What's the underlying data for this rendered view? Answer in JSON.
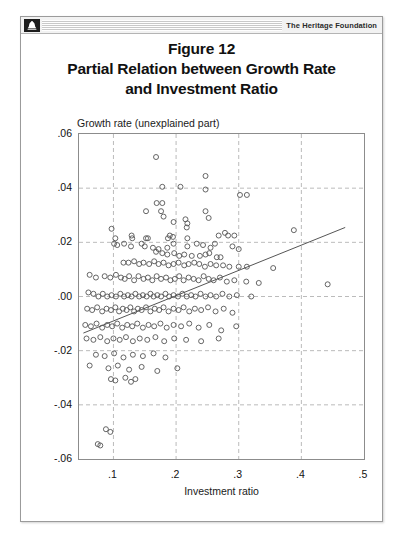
{
  "header": {
    "logo_icon": "liberty-bell-icon",
    "brand": "The Heritage Foundation"
  },
  "figure": {
    "title_lines": [
      "Figure 12",
      "Partial Relation between Growth Rate",
      "and Investment Ratio"
    ]
  },
  "chart_data": {
    "type": "scatter",
    "title": "Partial Relation between Growth Rate and Investment Ratio",
    "subtitle": "Figure 12",
    "xlabel": "Investment ratio",
    "ylabel": "Growth rate (unexplained part)",
    "xlim": [
      0.045,
      0.5
    ],
    "ylim": [
      -0.06,
      0.06
    ],
    "xticks": [
      0.1,
      0.2,
      0.3,
      0.4,
      0.5
    ],
    "xtick_labels": [
      ".1",
      ".2",
      ".3",
      ".4",
      ".5"
    ],
    "yticks": [
      -0.06,
      -0.04,
      -0.02,
      0.0,
      0.02,
      0.04,
      0.06
    ],
    "ytick_labels": [
      "-.06",
      "-.04",
      "-.02",
      ".00",
      ".02",
      ".04",
      ".06"
    ],
    "grid": true,
    "grid_style": "dashed",
    "legend": null,
    "marker": "open-circle",
    "marker_color": "#555555",
    "fit_line": {
      "name": "partial regression line",
      "color": "#555555",
      "x": [
        0.052,
        0.47
      ],
      "y": [
        -0.0135,
        0.0255
      ]
    },
    "points": [
      [
        0.168,
        0.0515
      ],
      [
        0.247,
        0.0445
      ],
      [
        0.247,
        0.0395
      ],
      [
        0.178,
        0.0405
      ],
      [
        0.207,
        0.0405
      ],
      [
        0.302,
        0.0375
      ],
      [
        0.313,
        0.0375
      ],
      [
        0.169,
        0.0345
      ],
      [
        0.178,
        0.0345
      ],
      [
        0.152,
        0.0315
      ],
      [
        0.176,
        0.0315
      ],
      [
        0.247,
        0.0315
      ],
      [
        0.18,
        0.0295
      ],
      [
        0.252,
        0.029
      ],
      [
        0.196,
        0.0275
      ],
      [
        0.215,
        0.0285
      ],
      [
        0.218,
        0.027
      ],
      [
        0.217,
        0.0255
      ],
      [
        0.097,
        0.025
      ],
      [
        0.388,
        0.0245
      ],
      [
        0.129,
        0.0225
      ],
      [
        0.103,
        0.0215
      ],
      [
        0.13,
        0.0215
      ],
      [
        0.152,
        0.0215
      ],
      [
        0.155,
        0.0215
      ],
      [
        0.187,
        0.0215
      ],
      [
        0.19,
        0.0225
      ],
      [
        0.195,
        0.022
      ],
      [
        0.218,
        0.0215
      ],
      [
        0.268,
        0.0225
      ],
      [
        0.278,
        0.0235
      ],
      [
        0.283,
        0.0225
      ],
      [
        0.293,
        0.0225
      ],
      [
        0.101,
        0.0195
      ],
      [
        0.106,
        0.019
      ],
      [
        0.117,
        0.0195
      ],
      [
        0.128,
        0.0185
      ],
      [
        0.145,
        0.0195
      ],
      [
        0.15,
        0.0185
      ],
      [
        0.163,
        0.018
      ],
      [
        0.172,
        0.0175
      ],
      [
        0.186,
        0.018
      ],
      [
        0.196,
        0.0195
      ],
      [
        0.218,
        0.0185
      ],
      [
        0.233,
        0.0195
      ],
      [
        0.243,
        0.019
      ],
      [
        0.255,
        0.018
      ],
      [
        0.262,
        0.0195
      ],
      [
        0.29,
        0.0185
      ],
      [
        0.3,
        0.0175
      ],
      [
        0.168,
        0.0165
      ],
      [
        0.178,
        0.016
      ],
      [
        0.186,
        0.0155
      ],
      [
        0.197,
        0.016
      ],
      [
        0.205,
        0.015
      ],
      [
        0.213,
        0.0155
      ],
      [
        0.225,
        0.015
      ],
      [
        0.238,
        0.015
      ],
      [
        0.247,
        0.0155
      ],
      [
        0.253,
        0.016
      ],
      [
        0.265,
        0.0145
      ],
      [
        0.271,
        0.0145
      ],
      [
        0.116,
        0.0125
      ],
      [
        0.124,
        0.0125
      ],
      [
        0.133,
        0.013
      ],
      [
        0.141,
        0.012
      ],
      [
        0.148,
        0.0125
      ],
      [
        0.157,
        0.012
      ],
      [
        0.165,
        0.013
      ],
      [
        0.172,
        0.012
      ],
      [
        0.18,
        0.0125
      ],
      [
        0.188,
        0.0115
      ],
      [
        0.196,
        0.012
      ],
      [
        0.204,
        0.0125
      ],
      [
        0.213,
        0.0115
      ],
      [
        0.22,
        0.012
      ],
      [
        0.229,
        0.0125
      ],
      [
        0.237,
        0.012
      ],
      [
        0.246,
        0.011
      ],
      [
        0.255,
        0.012
      ],
      [
        0.264,
        0.0115
      ],
      [
        0.275,
        0.0115
      ],
      [
        0.285,
        0.011
      ],
      [
        0.3,
        0.011
      ],
      [
        0.313,
        0.011
      ],
      [
        0.355,
        0.0105
      ],
      [
        0.062,
        0.008
      ],
      [
        0.072,
        0.007
      ],
      [
        0.086,
        0.0075
      ],
      [
        0.095,
        0.007
      ],
      [
        0.104,
        0.008
      ],
      [
        0.112,
        0.007
      ],
      [
        0.118,
        0.0065
      ],
      [
        0.125,
        0.0075
      ],
      [
        0.133,
        0.006
      ],
      [
        0.14,
        0.0075
      ],
      [
        0.148,
        0.0065
      ],
      [
        0.155,
        0.007
      ],
      [
        0.162,
        0.006
      ],
      [
        0.169,
        0.0075
      ],
      [
        0.176,
        0.0065
      ],
      [
        0.184,
        0.007
      ],
      [
        0.191,
        0.006
      ],
      [
        0.198,
        0.0065
      ],
      [
        0.205,
        0.0075
      ],
      [
        0.212,
        0.006
      ],
      [
        0.22,
        0.007
      ],
      [
        0.228,
        0.0065
      ],
      [
        0.236,
        0.006
      ],
      [
        0.244,
        0.0075
      ],
      [
        0.252,
        0.0065
      ],
      [
        0.26,
        0.006
      ],
      [
        0.27,
        0.007
      ],
      [
        0.281,
        0.0055
      ],
      [
        0.293,
        0.006
      ],
      [
        0.312,
        0.0055
      ],
      [
        0.332,
        0.005
      ],
      [
        0.442,
        0.0045
      ],
      [
        0.06,
        0.0015
      ],
      [
        0.068,
        0.001
      ],
      [
        0.076,
        0.0
      ],
      [
        0.083,
        0.001
      ],
      [
        0.09,
        0.0
      ],
      [
        0.097,
        0.0005
      ],
      [
        0.104,
        0.0
      ],
      [
        0.111,
        0.001
      ],
      [
        0.117,
        0.0
      ],
      [
        0.123,
        0.0005
      ],
      [
        0.129,
        0.0
      ],
      [
        0.135,
        0.001
      ],
      [
        0.141,
        0.0
      ],
      [
        0.147,
        0.0005
      ],
      [
        0.153,
        0.0
      ],
      [
        0.159,
        0.001
      ],
      [
        0.164,
        0.0
      ],
      [
        0.17,
        0.0005
      ],
      [
        0.176,
        0.0
      ],
      [
        0.183,
        0.001
      ],
      [
        0.189,
        0.0
      ],
      [
        0.196,
        0.0005
      ],
      [
        0.203,
        0.0
      ],
      [
        0.21,
        0.001
      ],
      [
        0.217,
        0.0
      ],
      [
        0.224,
        0.0005
      ],
      [
        0.231,
        0.0
      ],
      [
        0.239,
        0.001
      ],
      [
        0.247,
        0.0
      ],
      [
        0.255,
        0.0005
      ],
      [
        0.264,
        0.0
      ],
      [
        0.274,
        0.001
      ],
      [
        0.285,
        0.0
      ],
      [
        0.297,
        0.0005
      ],
      [
        0.32,
        0.0
      ],
      [
        0.058,
        -0.0045
      ],
      [
        0.066,
        -0.005
      ],
      [
        0.074,
        -0.004
      ],
      [
        0.082,
        -0.0055
      ],
      [
        0.089,
        -0.0045
      ],
      [
        0.096,
        -0.005
      ],
      [
        0.103,
        -0.004
      ],
      [
        0.109,
        -0.0055
      ],
      [
        0.115,
        -0.0045
      ],
      [
        0.121,
        -0.005
      ],
      [
        0.127,
        -0.004
      ],
      [
        0.133,
        -0.0055
      ],
      [
        0.139,
        -0.0045
      ],
      [
        0.145,
        -0.005
      ],
      [
        0.152,
        -0.004
      ],
      [
        0.159,
        -0.0055
      ],
      [
        0.166,
        -0.0045
      ],
      [
        0.173,
        -0.005
      ],
      [
        0.18,
        -0.004
      ],
      [
        0.188,
        -0.0055
      ],
      [
        0.196,
        -0.0045
      ],
      [
        0.204,
        -0.005
      ],
      [
        0.212,
        -0.004
      ],
      [
        0.221,
        -0.0055
      ],
      [
        0.23,
        -0.0045
      ],
      [
        0.24,
        -0.005
      ],
      [
        0.251,
        -0.004
      ],
      [
        0.263,
        -0.0055
      ],
      [
        0.276,
        -0.0045
      ],
      [
        0.29,
        -0.006
      ],
      [
        0.055,
        -0.0105
      ],
      [
        0.064,
        -0.011
      ],
      [
        0.073,
        -0.01
      ],
      [
        0.082,
        -0.0115
      ],
      [
        0.09,
        -0.0105
      ],
      [
        0.098,
        -0.011
      ],
      [
        0.106,
        -0.01
      ],
      [
        0.114,
        -0.0115
      ],
      [
        0.122,
        -0.0105
      ],
      [
        0.13,
        -0.011
      ],
      [
        0.138,
        -0.01
      ],
      [
        0.147,
        -0.0115
      ],
      [
        0.156,
        -0.0105
      ],
      [
        0.165,
        -0.011
      ],
      [
        0.175,
        -0.01
      ],
      [
        0.185,
        -0.0115
      ],
      [
        0.196,
        -0.0105
      ],
      [
        0.208,
        -0.011
      ],
      [
        0.221,
        -0.01
      ],
      [
        0.236,
        -0.0115
      ],
      [
        0.253,
        -0.0105
      ],
      [
        0.272,
        -0.0125
      ],
      [
        0.296,
        -0.011
      ],
      [
        0.057,
        -0.0155
      ],
      [
        0.068,
        -0.016
      ],
      [
        0.079,
        -0.015
      ],
      [
        0.09,
        -0.0165
      ],
      [
        0.1,
        -0.0155
      ],
      [
        0.11,
        -0.016
      ],
      [
        0.12,
        -0.015
      ],
      [
        0.131,
        -0.0165
      ],
      [
        0.142,
        -0.0155
      ],
      [
        0.154,
        -0.016
      ],
      [
        0.167,
        -0.015
      ],
      [
        0.181,
        -0.0165
      ],
      [
        0.197,
        -0.0155
      ],
      [
        0.216,
        -0.016
      ],
      [
        0.24,
        -0.0165
      ],
      [
        0.268,
        -0.0155
      ],
      [
        0.072,
        -0.0215
      ],
      [
        0.086,
        -0.022
      ],
      [
        0.101,
        -0.021
      ],
      [
        0.116,
        -0.0225
      ],
      [
        0.131,
        -0.0215
      ],
      [
        0.147,
        -0.022
      ],
      [
        0.164,
        -0.021
      ],
      [
        0.183,
        -0.0225
      ],
      [
        0.062,
        -0.0255
      ],
      [
        0.092,
        -0.0265
      ],
      [
        0.107,
        -0.0255
      ],
      [
        0.125,
        -0.027
      ],
      [
        0.145,
        -0.026
      ],
      [
        0.17,
        -0.0275
      ],
      [
        0.202,
        -0.0265
      ],
      [
        0.096,
        -0.0305
      ],
      [
        0.103,
        -0.031
      ],
      [
        0.119,
        -0.03
      ],
      [
        0.128,
        -0.0315
      ],
      [
        0.135,
        -0.0305
      ],
      [
        0.088,
        -0.049
      ],
      [
        0.095,
        -0.05
      ],
      [
        0.075,
        -0.0545
      ],
      [
        0.079,
        -0.055
      ]
    ]
  }
}
